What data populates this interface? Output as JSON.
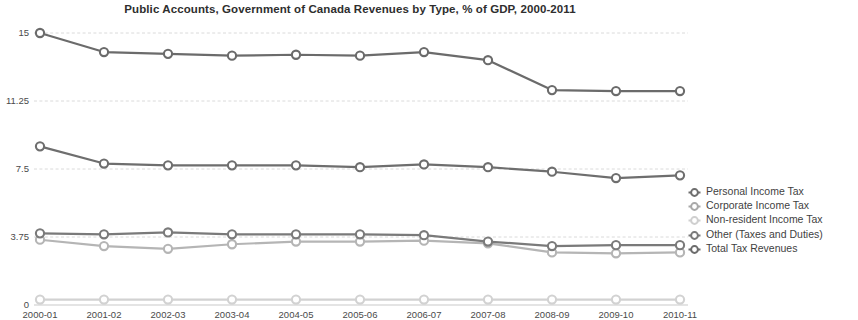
{
  "chart_data": {
    "type": "line",
    "title": "Public Accounts, Government of Canada Revenues by Type, % of GDP, 2000-2011",
    "xlabel": "",
    "ylabel": "",
    "categories": [
      "2000-01",
      "2001-02",
      "2002-03",
      "2003-04",
      "2004-05",
      "2005-06",
      "2006-07",
      "2007-08",
      "2008-09",
      "2009-10",
      "2010-11"
    ],
    "ylim": [
      0,
      15
    ],
    "yticks": [
      0,
      3.75,
      7.5,
      11.25,
      15
    ],
    "ytick_labels": [
      "0",
      "3.75",
      "7.5",
      "11.25",
      "15"
    ],
    "grid": true,
    "legend_position": "right",
    "series": [
      {
        "name": "Personal Income Tax",
        "color": "#6e6e6e",
        "values": [
          8.75,
          7.8,
          7.7,
          7.7,
          7.7,
          7.6,
          7.75,
          7.6,
          7.35,
          7.0,
          7.15
        ]
      },
      {
        "name": "Corporate Income Tax",
        "color": "#b5b5b5",
        "values": [
          3.6,
          3.25,
          3.1,
          3.35,
          3.5,
          3.5,
          3.55,
          3.4,
          2.9,
          2.85,
          2.9
        ]
      },
      {
        "name": "Non-resident Income Tax",
        "color": "#d2d2d2",
        "values": [
          0.3,
          0.3,
          0.3,
          0.3,
          0.3,
          0.3,
          0.3,
          0.3,
          0.3,
          0.3,
          0.3
        ]
      },
      {
        "name": "Other (Taxes and Duties)",
        "color": "#7a7a7a",
        "values": [
          3.95,
          3.9,
          4.0,
          3.9,
          3.9,
          3.9,
          3.85,
          3.5,
          3.25,
          3.3,
          3.3
        ]
      },
      {
        "name": "Total Tax Revenues",
        "color": "#6b6b6b",
        "values": [
          15.0,
          13.95,
          13.85,
          13.75,
          13.8,
          13.75,
          13.95,
          13.5,
          11.85,
          11.8,
          11.8
        ]
      }
    ]
  },
  "legend": {
    "items": [
      {
        "label": "Personal Income Tax",
        "marker_color": "#6e6e6e"
      },
      {
        "label": "Corporate Income Tax",
        "marker_color": "#a8a8a8"
      },
      {
        "label": "Non-resident Income Tax",
        "marker_color": "#cfcfcf"
      },
      {
        "label": "Other (Taxes and Duties)",
        "marker_color": "#7a7a7a"
      },
      {
        "label": "Total Tax Revenues",
        "marker_color": "#6b6b6b"
      }
    ]
  }
}
